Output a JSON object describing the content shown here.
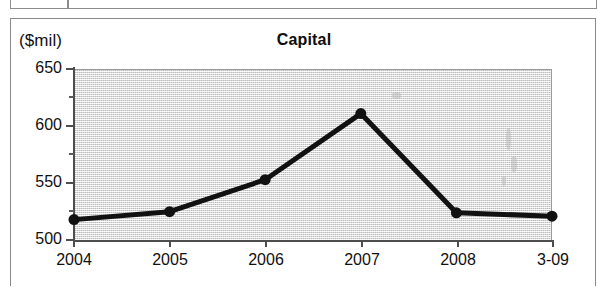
{
  "page": {
    "background_color": "#ffffff",
    "border_color": "#8a8a8a",
    "table_fragment": {
      "left_cell_text": "",
      "right_cell_text": ""
    }
  },
  "figure": {
    "title": "Capital",
    "unit_label": "($mil)",
    "plot_background_color": "#e2e2e2",
    "series_color": "#111111",
    "axis_color": "#4d4d4d"
  },
  "chart_data": {
    "type": "line",
    "title": "Capital",
    "xlabel": "",
    "ylabel": "($mil)",
    "categories": [
      "2004",
      "2005",
      "2006",
      "2007",
      "2008",
      "3-09"
    ],
    "values": [
      517,
      524,
      552,
      610,
      523,
      520
    ],
    "series": [
      {
        "name": "Capital",
        "values": [
          517,
          524,
          552,
          610,
          523,
          520
        ]
      }
    ],
    "ylim": [
      500,
      650
    ],
    "y_major_ticks": [
      500,
      550,
      600,
      650
    ],
    "y_minor_ticks": [
      525,
      575,
      625
    ],
    "y_tick_labels": [
      "500",
      "550",
      "600",
      "650"
    ],
    "x_tick_labels": [
      "2004",
      "2005",
      "2006",
      "2007",
      "2008",
      "3-09"
    ],
    "grid": false,
    "legend": false,
    "marker": "circle",
    "marker_size": 11,
    "line_width": 5
  }
}
